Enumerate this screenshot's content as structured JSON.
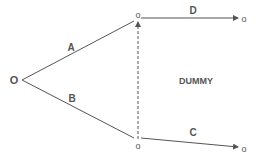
{
  "diagram": {
    "type": "activity-network",
    "colors": {
      "line": "#555555",
      "text": "#555555",
      "background": "#ffffff"
    },
    "nodes": [
      {
        "id": "start",
        "label": "O",
        "x": 14,
        "y": 84
      },
      {
        "id": "top",
        "label": "o",
        "x": 138,
        "y": 18
      },
      {
        "id": "bottom",
        "label": "o",
        "x": 138,
        "y": 149
      },
      {
        "id": "end_top",
        "label": "o",
        "x": 244,
        "y": 22
      },
      {
        "id": "end_bottom",
        "label": "o",
        "x": 244,
        "y": 152
      }
    ],
    "edges": [
      {
        "id": "A",
        "label": "A",
        "from": "start",
        "to": "top",
        "style": "solid"
      },
      {
        "id": "B",
        "label": "B",
        "from": "start",
        "to": "bottom",
        "style": "solid"
      },
      {
        "id": "D",
        "label": "D",
        "from": "top",
        "to": "end_top",
        "style": "solid",
        "arrow": true
      },
      {
        "id": "C",
        "label": "C",
        "from": "bottom",
        "to": "end_bottom",
        "style": "solid",
        "arrow": true
      },
      {
        "id": "dummy",
        "label": "DUMMY",
        "from": "bottom",
        "to": "top",
        "style": "dashed",
        "arrow": true
      }
    ]
  }
}
